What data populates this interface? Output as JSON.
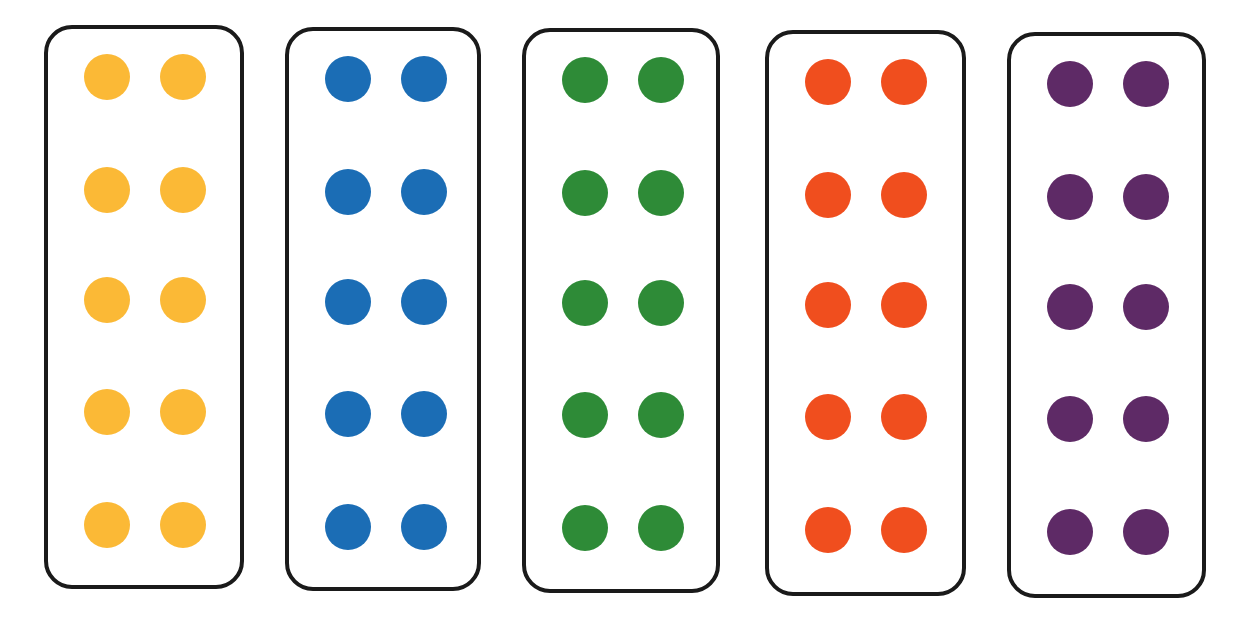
{
  "cards": [
    {
      "name": "yellow",
      "color": "#FBB936",
      "x": 44,
      "y": 25,
      "w": 200,
      "h": 564,
      "dot_count": 10
    },
    {
      "name": "blue",
      "color": "#1B6DB5",
      "x": 285,
      "y": 27,
      "w": 196,
      "h": 564,
      "dot_count": 10
    },
    {
      "name": "green",
      "color": "#2E8B37",
      "x": 522,
      "y": 28,
      "w": 198,
      "h": 565,
      "dot_count": 10
    },
    {
      "name": "orange",
      "color": "#F04E1E",
      "x": 765,
      "y": 30,
      "w": 201,
      "h": 566,
      "dot_count": 10
    },
    {
      "name": "purple",
      "color": "#5E2A66",
      "x": 1007,
      "y": 32,
      "w": 199,
      "h": 566,
      "dot_count": 10
    }
  ],
  "layout": {
    "columns": 2,
    "rows": 5,
    "dot_diameter": 46,
    "col_offsets": [
      40,
      116
    ],
    "row_offsets": [
      29,
      142,
      252,
      364,
      477
    ]
  }
}
